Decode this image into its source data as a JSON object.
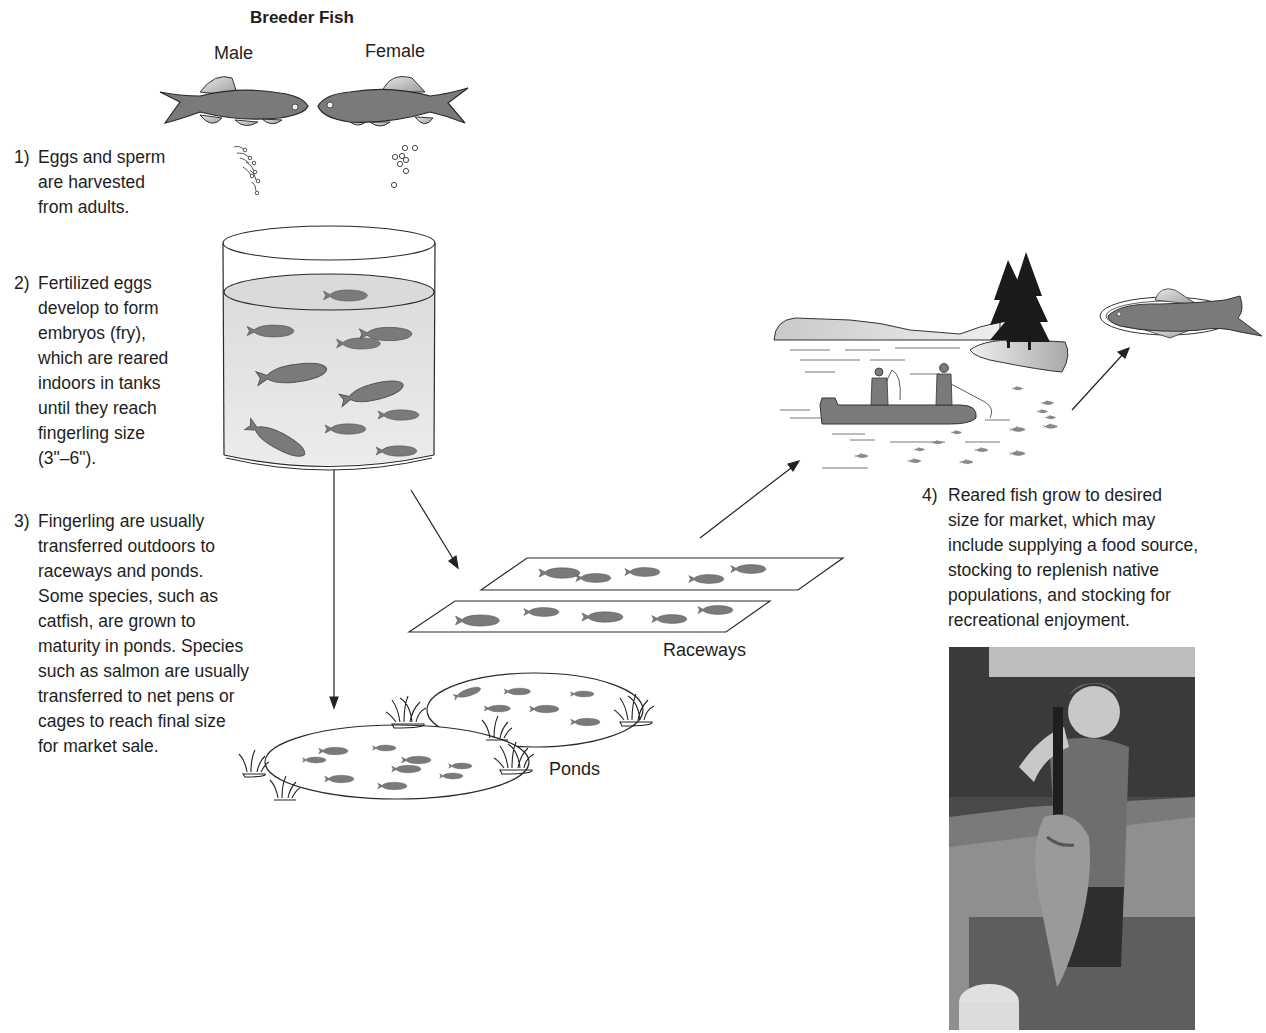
{
  "diagram": {
    "title": "Breeder Fish",
    "breeders": {
      "male_label": "Male",
      "female_label": "Female"
    },
    "steps": [
      {
        "number": "1)",
        "lines": [
          "Eggs and sperm",
          "are harvested",
          "from adults."
        ]
      },
      {
        "number": "2)",
        "lines": [
          "Fertilized eggs",
          "develop to form",
          "embryos (fry),",
          "which are reared",
          "indoors in tanks",
          "until they reach",
          "fingerling size",
          "(3\"–6\")."
        ]
      },
      {
        "number": "3)",
        "lines": [
          "Fingerling are usually",
          "transferred outdoors to",
          "raceways and ponds.",
          "Some species, such as",
          "catfish, are grown to",
          "maturity in ponds. Species",
          "such as salmon are usually",
          "transferred to net pens or",
          "cages to reach final size",
          "for market sale."
        ]
      },
      {
        "number": "4)",
        "lines": [
          "Reared fish grow to desired",
          "size for market, which may",
          "include supplying a food source,",
          "stocking to replenish native",
          "populations, and stocking for",
          "recreational enjoyment."
        ]
      }
    ],
    "labels": {
      "raceways": "Raceways",
      "ponds": "Ponds"
    },
    "illustrations": [
      {
        "id": "breeder-male",
        "desc": "male fish facing right releasing sperm"
      },
      {
        "id": "breeder-female",
        "desc": "female fish facing left releasing eggs"
      },
      {
        "id": "indoor-tank",
        "desc": "cylindrical tank with fry"
      },
      {
        "id": "raceways",
        "desc": "two rectangular raceways with fish"
      },
      {
        "id": "ponds",
        "desc": "two oval ponds with grass tufts and fish"
      },
      {
        "id": "lake-scene",
        "desc": "two anglers in boat on lake with trees and island"
      },
      {
        "id": "plated-fish",
        "desc": "fish on a plate (food source)"
      },
      {
        "id": "photo",
        "desc": "child holding a large bass on a boat"
      }
    ],
    "colors": {
      "fish_fill": "#7a7a7a",
      "fin_fill": "#c8c8c8",
      "line": "#2a2a2a",
      "water": "#e4e4e4",
      "tree": "#1a1a1a"
    }
  }
}
